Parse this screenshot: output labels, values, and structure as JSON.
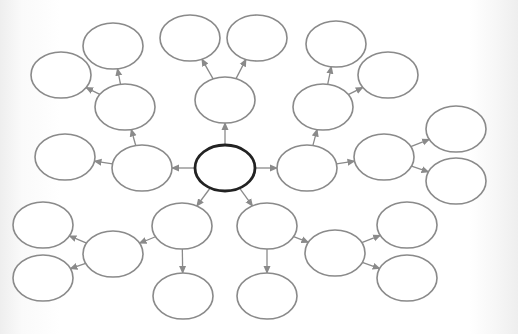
{
  "diagram": {
    "type": "concept-web",
    "colors": {
      "node_stroke": "#8a8a8a",
      "root_stroke": "#222222",
      "edge": "#8a8a8a",
      "fill": "#ffffff"
    },
    "nodes": [
      {
        "id": "root",
        "cx": 225,
        "cy": 168,
        "rx": 30,
        "ry": 23,
        "label": "",
        "root": true
      },
      {
        "id": "left",
        "cx": 142,
        "cy": 168,
        "rx": 30,
        "ry": 23,
        "label": ""
      },
      {
        "id": "left-1",
        "cx": 65,
        "cy": 157,
        "rx": 30,
        "ry": 23,
        "label": ""
      },
      {
        "id": "upleft",
        "cx": 125,
        "cy": 107,
        "rx": 30,
        "ry": 23,
        "label": ""
      },
      {
        "id": "upleft-1",
        "cx": 113,
        "cy": 46,
        "rx": 30,
        "ry": 23,
        "label": ""
      },
      {
        "id": "upleft-2",
        "cx": 61,
        "cy": 75,
        "rx": 30,
        "ry": 23,
        "label": ""
      },
      {
        "id": "top",
        "cx": 225,
        "cy": 100,
        "rx": 30,
        "ry": 23,
        "label": ""
      },
      {
        "id": "top-1",
        "cx": 190,
        "cy": 38,
        "rx": 30,
        "ry": 23,
        "label": ""
      },
      {
        "id": "top-2",
        "cx": 257,
        "cy": 38,
        "rx": 30,
        "ry": 23,
        "label": ""
      },
      {
        "id": "upright",
        "cx": 323,
        "cy": 107,
        "rx": 30,
        "ry": 23,
        "label": ""
      },
      {
        "id": "upright-1",
        "cx": 336,
        "cy": 44,
        "rx": 30,
        "ry": 23,
        "label": ""
      },
      {
        "id": "upright-2",
        "cx": 388,
        "cy": 75,
        "rx": 30,
        "ry": 23,
        "label": ""
      },
      {
        "id": "right",
        "cx": 307,
        "cy": 168,
        "rx": 30,
        "ry": 23,
        "label": ""
      },
      {
        "id": "right-1",
        "cx": 384,
        "cy": 157,
        "rx": 30,
        "ry": 23,
        "label": ""
      },
      {
        "id": "right-1-1",
        "cx": 456,
        "cy": 129,
        "rx": 30,
        "ry": 23,
        "label": ""
      },
      {
        "id": "right-1-2",
        "cx": 456,
        "cy": 181,
        "rx": 30,
        "ry": 23,
        "label": ""
      },
      {
        "id": "lowleft",
        "cx": 182,
        "cy": 226,
        "rx": 30,
        "ry": 23,
        "label": ""
      },
      {
        "id": "lowleft-down",
        "cx": 183,
        "cy": 296,
        "rx": 30,
        "ry": 23,
        "label": ""
      },
      {
        "id": "lowleft-side",
        "cx": 113,
        "cy": 254,
        "rx": 30,
        "ry": 23,
        "label": ""
      },
      {
        "id": "lowleft-side-1",
        "cx": 43,
        "cy": 225,
        "rx": 30,
        "ry": 23,
        "label": ""
      },
      {
        "id": "lowleft-side-2",
        "cx": 43,
        "cy": 278,
        "rx": 30,
        "ry": 23,
        "label": ""
      },
      {
        "id": "lowright",
        "cx": 267,
        "cy": 226,
        "rx": 30,
        "ry": 23,
        "label": ""
      },
      {
        "id": "lowright-down",
        "cx": 267,
        "cy": 296,
        "rx": 30,
        "ry": 23,
        "label": ""
      },
      {
        "id": "lowright-side",
        "cx": 335,
        "cy": 253,
        "rx": 30,
        "ry": 23,
        "label": ""
      },
      {
        "id": "lowright-side-1",
        "cx": 407,
        "cy": 225,
        "rx": 30,
        "ry": 23,
        "label": ""
      },
      {
        "id": "lowright-side-2",
        "cx": 407,
        "cy": 278,
        "rx": 30,
        "ry": 23,
        "label": ""
      }
    ],
    "edges": [
      {
        "from": "root",
        "to": "left"
      },
      {
        "from": "left",
        "to": "left-1"
      },
      {
        "from": "left",
        "to": "upleft"
      },
      {
        "from": "upleft",
        "to": "upleft-1"
      },
      {
        "from": "upleft",
        "to": "upleft-2"
      },
      {
        "from": "root",
        "to": "top"
      },
      {
        "from": "top",
        "to": "top-1"
      },
      {
        "from": "top",
        "to": "top-2"
      },
      {
        "from": "right",
        "to": "upright"
      },
      {
        "from": "upright",
        "to": "upright-1"
      },
      {
        "from": "upright",
        "to": "upright-2"
      },
      {
        "from": "root",
        "to": "right"
      },
      {
        "from": "right",
        "to": "right-1"
      },
      {
        "from": "right-1",
        "to": "right-1-1"
      },
      {
        "from": "right-1",
        "to": "right-1-2"
      },
      {
        "from": "root",
        "to": "lowleft"
      },
      {
        "from": "lowleft",
        "to": "lowleft-down"
      },
      {
        "from": "lowleft",
        "to": "lowleft-side"
      },
      {
        "from": "lowleft-side",
        "to": "lowleft-side-1"
      },
      {
        "from": "lowleft-side",
        "to": "lowleft-side-2"
      },
      {
        "from": "root",
        "to": "lowright"
      },
      {
        "from": "lowright",
        "to": "lowright-down"
      },
      {
        "from": "lowright",
        "to": "lowright-side"
      },
      {
        "from": "lowright-side",
        "to": "lowright-side-1"
      },
      {
        "from": "lowright-side",
        "to": "lowright-side-2"
      }
    ]
  }
}
